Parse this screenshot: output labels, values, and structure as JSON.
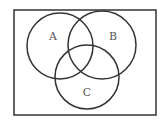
{
  "diagram": {
    "type": "venn",
    "universe": {
      "x": 14,
      "y": 10,
      "width": 142,
      "height": 105
    },
    "sets": [
      {
        "label": "A",
        "cx": 60,
        "cy": 46,
        "r": 33,
        "label_x": 53,
        "label_y": 40
      },
      {
        "label": "B",
        "cx": 102,
        "cy": 45,
        "r": 34,
        "label_x": 113,
        "label_y": 40
      },
      {
        "label": "C",
        "cx": 87,
        "cy": 77,
        "r": 32,
        "label_x": 87,
        "label_y": 96
      }
    ],
    "stroke_color": "#333333"
  }
}
